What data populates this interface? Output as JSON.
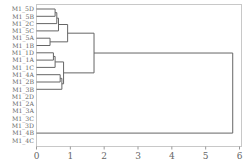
{
  "chart_data": {
    "type": "dendrogram",
    "title": "",
    "xlabel": "",
    "ylabel": "",
    "xlim": [
      0,
      6
    ],
    "x_ticks": [
      0,
      1,
      2,
      3,
      4,
      5,
      6
    ],
    "orientation": "horizontal",
    "leaves": [
      "M1_5D",
      "M1_5B",
      "M1_2C",
      "M1_5C",
      "M1_5A",
      "M1_1B",
      "M1_1D",
      "M1_1A",
      "M1_1C",
      "M1_4A",
      "M1_2B",
      "M1_3B",
      "M1_2D",
      "M1_2A",
      "M1_3A",
      "M1_3C",
      "M1_3D",
      "M1_4B",
      "M1_4C"
    ],
    "merges": [
      {
        "id": "n1",
        "children": [
          "M1_5D",
          "M1_5B"
        ],
        "height": 0.55
      },
      {
        "id": "n2",
        "children": [
          "n1",
          "M1_2C"
        ],
        "height": 0.6
      },
      {
        "id": "n3",
        "children": [
          "n2",
          "M1_5C"
        ],
        "height": 0.65
      },
      {
        "id": "n4",
        "children": [
          "M1_5A",
          "M1_1B"
        ],
        "height": 0.4
      },
      {
        "id": "n5",
        "children": [
          "n3",
          "n4"
        ],
        "height": 0.92
      },
      {
        "id": "n6",
        "children": [
          "M1_1D",
          "M1_1A"
        ],
        "height": 0.5
      },
      {
        "id": "n7",
        "children": [
          "n6",
          "M1_1C"
        ],
        "height": 0.55
      },
      {
        "id": "n8",
        "children": [
          "M1_4A",
          "M1_2B"
        ],
        "height": 0.7
      },
      {
        "id": "n9",
        "children": [
          "n8",
          "M1_3B"
        ],
        "height": 0.75
      },
      {
        "id": "n10",
        "children": [
          "n7",
          "n9"
        ],
        "height": 0.8
      },
      {
        "id": "n11",
        "children": [
          "n5",
          "n10"
        ],
        "height": 1.7
      },
      {
        "id": "n12",
        "children": [
          "n11",
          "M1_4B"
        ],
        "height": 5.8
      }
    ],
    "grid": false,
    "legend": "none"
  }
}
